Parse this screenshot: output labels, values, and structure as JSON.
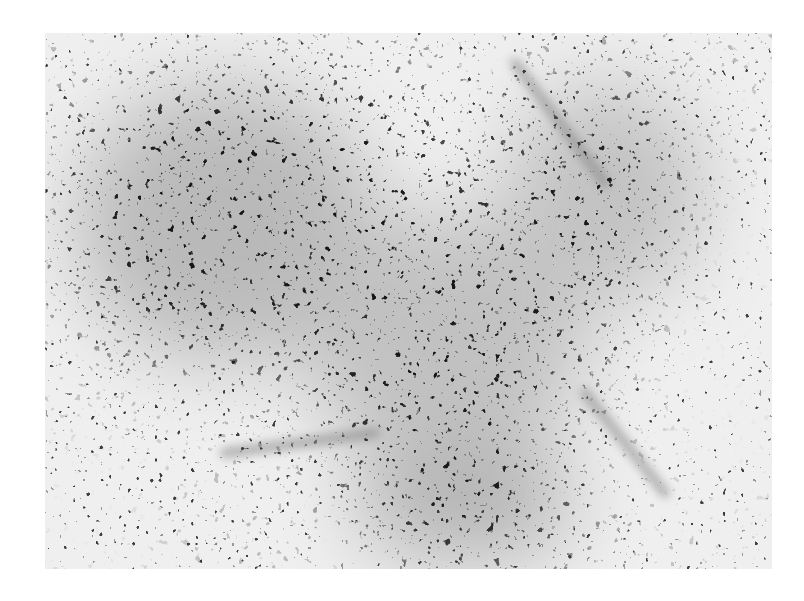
{
  "image": {
    "kind": "grayscale micrograph",
    "subject": "histological tissue section with densely packed dark-stained cell nuclei",
    "frame": {
      "x": 45,
      "y": 33,
      "width": 727,
      "height": 536
    },
    "background_color": "#ffffff",
    "colors": {
      "nuclei": "#1a1a1a",
      "stroma": "#8a8a8a",
      "light_matrix": "#f0f0f0"
    },
    "dense_regions": [
      {
        "cx": 170,
        "cy": 180,
        "rx": 160,
        "ry": 150,
        "label": "upper-left dense cluster"
      },
      {
        "cx": 390,
        "cy": 300,
        "rx": 150,
        "ry": 140,
        "label": "central dense area"
      },
      {
        "cx": 420,
        "cy": 470,
        "rx": 120,
        "ry": 70,
        "label": "lower-center dense area"
      },
      {
        "cx": 560,
        "cy": 170,
        "rx": 110,
        "ry": 120,
        "label": "upper-right dense area"
      }
    ],
    "fibrous_streaks": [
      {
        "x1": 470,
        "y1": 30,
        "x2": 560,
        "y2": 150
      },
      {
        "x1": 180,
        "y1": 420,
        "x2": 330,
        "y2": 400
      },
      {
        "x1": 540,
        "y1": 360,
        "x2": 620,
        "y2": 460
      }
    ]
  }
}
